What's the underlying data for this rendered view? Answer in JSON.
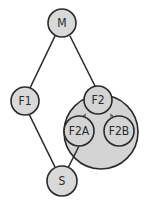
{
  "diagram": {
    "nodes": [
      {
        "id": "M",
        "label": "M"
      },
      {
        "id": "F1",
        "label": "F1"
      },
      {
        "id": "F2",
        "label": "F2"
      },
      {
        "id": "F2A",
        "label": "F2A"
      },
      {
        "id": "F2B",
        "label": "F2B"
      },
      {
        "id": "S",
        "label": "S"
      }
    ],
    "edges": [
      {
        "from": "M",
        "to": "F1"
      },
      {
        "from": "M",
        "to": "F2"
      },
      {
        "from": "F1",
        "to": "S"
      },
      {
        "from": "F2A",
        "to": "S"
      },
      {
        "from": "F2",
        "to": "F2A",
        "style": "short-arrow"
      },
      {
        "from": "F2",
        "to": "F2B",
        "style": "short-arrow"
      }
    ],
    "groups": [
      {
        "id": "F2-group",
        "contains": [
          "F2",
          "F2A",
          "F2B"
        ]
      }
    ],
    "colors": {
      "stroke": "#2a2a2a",
      "node_fill": "#d9d9d9",
      "group_fill": "#d4d4d4",
      "background": "#ffffff"
    }
  }
}
